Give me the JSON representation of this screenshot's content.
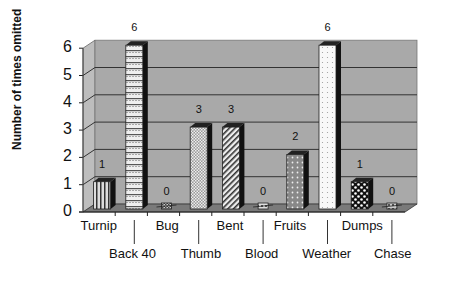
{
  "chart_data": {
    "type": "bar",
    "title": "",
    "xlabel": "",
    "ylabel": "Number of times omitted",
    "ylim": [
      0,
      6
    ],
    "yticks": [
      "0",
      "1",
      "2",
      "3",
      "4",
      "5",
      "6"
    ],
    "grid": true,
    "three_d": true,
    "legend": "none",
    "categories": [
      "Turnip",
      "Back 40",
      "Bug",
      "Thumb",
      "Bent",
      "Blood",
      "Fruits",
      "Weather",
      "Dumps",
      "Chase"
    ],
    "values": [
      1,
      6,
      0,
      3,
      3,
      0,
      2,
      6,
      1,
      0
    ],
    "data_labels": [
      "1",
      "6",
      "0",
      "3",
      "3",
      "0",
      "2",
      "6",
      "1",
      "0"
    ],
    "label_rows": [
      "top",
      "bottom",
      "top",
      "bottom",
      "top",
      "bottom",
      "top",
      "bottom",
      "top",
      "bottom"
    ],
    "colors": {
      "wall": "#a9a9a9",
      "floor": "#7a7a7a",
      "gridline": "#333333",
      "bar_shade": "#111111"
    }
  }
}
